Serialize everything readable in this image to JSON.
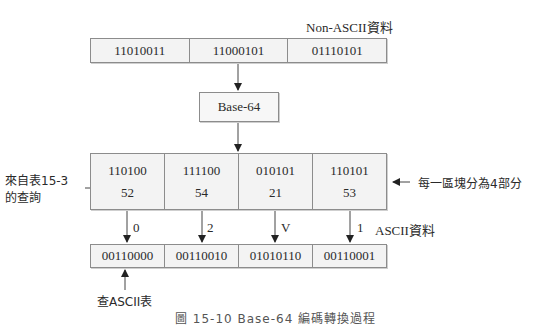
{
  "diagram": {
    "non_ascii_label": "Non-ASCII資料",
    "input_bytes": [
      "11010011",
      "11000101",
      "01110101"
    ],
    "encoder_label": "Base-64",
    "sextets": [
      {
        "bits": "110100",
        "value": "52"
      },
      {
        "bits": "111100",
        "value": "54"
      },
      {
        "bits": "010101",
        "value": "21"
      },
      {
        "bits": "110101",
        "value": "53"
      }
    ],
    "chars": [
      "0",
      "2",
      "V",
      "1"
    ],
    "ascii_label": "ASCII資料",
    "output_bytes": [
      "00110000",
      "00110010",
      "01010110",
      "00110001"
    ],
    "left_note_line1": "來自表15-3",
    "left_note_line2": "的查詢",
    "right_note": "每一區塊分為4部分",
    "bottom_note": "查ASCII表",
    "caption": "圖 15-10 Base-64 編碼轉換過程"
  }
}
